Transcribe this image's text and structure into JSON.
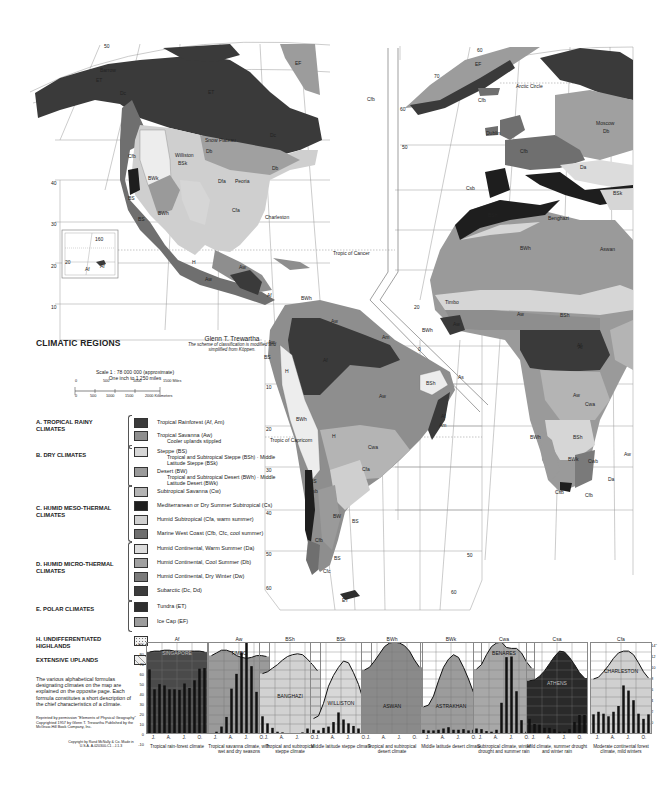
{
  "legend": {
    "title": "CLIMATIC REGIONS",
    "author": "Glenn T. Trewartha",
    "author_note": "The scheme of classification is modified and simplified from Köppen.",
    "scale": {
      "line1": "Scale 1 : 78 000 000 (approximate)",
      "line2": "One inch to 1 250 miles",
      "miles_ticks": [
        "0",
        "500",
        "1000",
        "1500 Miles"
      ],
      "km_ticks": [
        "0",
        "500",
        "1000",
        "1500",
        "2000 Kilometers"
      ]
    },
    "groups": [
      {
        "label": "A. TROPICAL RAINY CLIMATES",
        "items": [
          {
            "label": "Tropical Rainforest (Af, Am)",
            "sub": "",
            "color": "#3a3a3a"
          },
          {
            "label": "Tropical Savanna (Aw)",
            "sub": "Cooler uplands stippled",
            "color": "#8e8e8e"
          }
        ]
      },
      {
        "label": "B. DRY CLIMATES",
        "items": [
          {
            "label": "Steppe (BS)",
            "sub": "Tropical and Subtropical Steppe (BSh) · Middle Latitude Steppe (BSk)",
            "color": "#d6d6d6"
          },
          {
            "label": "Desert (BW)",
            "sub": "Tropical and Subtropical Desert (BWh) · Middle Latitude Desert (BWk)",
            "color": "#9a9a9a"
          }
        ]
      },
      {
        "label": "C. HUMID MESO-THERMAL CLIMATES",
        "items": [
          {
            "label": "Subtropical Savanna (Cw)",
            "sub": "",
            "color": "#b4b4b4"
          },
          {
            "label": "Mediterranean or Dry Summer Subtropical (Cs)",
            "sub": "",
            "color": "#1e1e1e"
          },
          {
            "label": "Humid Subtropical (Cfa, warm summer)",
            "sub": "",
            "color": "#cfcfcf"
          },
          {
            "label": "Marine West Coast (Cfb, Cfc, cool summer)",
            "sub": "",
            "color": "#6f6f6f"
          }
        ]
      },
      {
        "label": "D. HUMID MICRO-THERMAL CLIMATES",
        "items": [
          {
            "label": "Humid Continental, Warm Summer (Da)",
            "sub": "",
            "color": "#dcdcdc"
          },
          {
            "label": "Humid Continental, Cool Summer (Db)",
            "sub": "",
            "color": "#a0a0a0"
          },
          {
            "label": "Humid Continental, Dry Winter (Dw)",
            "sub": "",
            "color": "#7a7a7a"
          },
          {
            "label": "Subarctic (Dc, Dd)",
            "sub": "",
            "color": "#3c3c3c"
          }
        ]
      },
      {
        "label": "E. POLAR CLIMATES",
        "items": [
          {
            "label": "Tundra (ET)",
            "sub": "",
            "color": "#2e2e2e"
          },
          {
            "label": "Ice Cap (EF)",
            "sub": "",
            "color": "#9c9c9c"
          }
        ]
      },
      {
        "label": "H. UNDIFFERENTIATED HIGHLANDS",
        "items": [
          {
            "label": "",
            "sub": "",
            "color": "#f2f2f2"
          }
        ]
      },
      {
        "label": "EXTENSIVE UPLANDS",
        "items": [
          {
            "label": "",
            "sub": "",
            "color": "#ededed"
          }
        ]
      }
    ],
    "note": "The various alphabetical formulas designating climates on the map are explained on the opposite page. Each formula constitutes a short description of the chief characteristics of a climate.",
    "credit": "Reprinted by permission \"Elements of Physical Geography\" Copyrighted 1957 by Glenn T. Trewartha Published by the McGraw-Hill Book Company, Inc.",
    "credit2": "Copyright by Rand McNally & Co. Made in U.S.A. A-020300-C1 - J.1.3"
  },
  "map_labels": [
    {
      "t": "Barrow",
      "x": 100,
      "y": 67
    },
    {
      "t": "ET",
      "x": 96,
      "y": 77
    },
    {
      "t": "Dc",
      "x": 120,
      "y": 90
    },
    {
      "t": "ET",
      "x": 208,
      "y": 89
    },
    {
      "t": "EF",
      "x": 295,
      "y": 60
    },
    {
      "t": "Dc",
      "x": 270,
      "y": 132
    },
    {
      "t": "Snow Plateau",
      "x": 205,
      "y": 137
    },
    {
      "t": "Cfb",
      "x": 128,
      "y": 153
    },
    {
      "t": "Db",
      "x": 206,
      "y": 148
    },
    {
      "t": "Williston",
      "x": 175,
      "y": 152
    },
    {
      "t": "BSk",
      "x": 178,
      "y": 160
    },
    {
      "t": "Db",
      "x": 272,
      "y": 165
    },
    {
      "t": "Dfa",
      "x": 218,
      "y": 178
    },
    {
      "t": "Peoria",
      "x": 235,
      "y": 178
    },
    {
      "t": "BWk",
      "x": 148,
      "y": 175
    },
    {
      "t": "BS",
      "x": 128,
      "y": 195
    },
    {
      "t": "Cfa",
      "x": 232,
      "y": 207
    },
    {
      "t": "Charleston",
      "x": 265,
      "y": 214
    },
    {
      "t": "BWh",
      "x": 158,
      "y": 210
    },
    {
      "t": "BS",
      "x": 138,
      "y": 216
    },
    {
      "t": "H",
      "x": 192,
      "y": 259
    },
    {
      "t": "Aw",
      "x": 239,
      "y": 264
    },
    {
      "t": "Aw",
      "x": 205,
      "y": 276
    },
    {
      "t": "Af",
      "x": 267,
      "y": 292
    },
    {
      "t": "BWh",
      "x": 301,
      "y": 295
    },
    {
      "t": "Af",
      "x": 85,
      "y": 266
    },
    {
      "t": "Tropic of Cancer",
      "x": 333,
      "y": 250
    },
    {
      "t": "Arctic Circle",
      "x": 516,
      "y": 83
    },
    {
      "t": "EF",
      "x": 475,
      "y": 61
    },
    {
      "t": "Cfb",
      "x": 478,
      "y": 97
    },
    {
      "t": "Cfb",
      "x": 367,
      "y": 96
    },
    {
      "t": "Dublin",
      "x": 486,
      "y": 130
    },
    {
      "t": "Moscow",
      "x": 596,
      "y": 120
    },
    {
      "t": "Db",
      "x": 603,
      "y": 128
    },
    {
      "t": "Cfb",
      "x": 520,
      "y": 148
    },
    {
      "t": "Da",
      "x": 580,
      "y": 164
    },
    {
      "t": "Csb",
      "x": 466,
      "y": 185
    },
    {
      "t": "BSk",
      "x": 613,
      "y": 190
    },
    {
      "t": "BSh",
      "x": 488,
      "y": 212
    },
    {
      "t": "Benghazi",
      "x": 548,
      "y": 215
    },
    {
      "t": "BWh",
      "x": 520,
      "y": 245
    },
    {
      "t": "Aswan",
      "x": 600,
      "y": 246
    },
    {
      "t": "Timbo",
      "x": 445,
      "y": 299
    },
    {
      "t": "BSh",
      "x": 560,
      "y": 312
    },
    {
      "t": "Aw",
      "x": 517,
      "y": 311
    },
    {
      "t": "Aw",
      "x": 453,
      "y": 321
    },
    {
      "t": "BWh",
      "x": 422,
      "y": 327
    },
    {
      "t": "Af",
      "x": 578,
      "y": 344
    },
    {
      "t": "Aw",
      "x": 331,
      "y": 318
    },
    {
      "t": "Am",
      "x": 382,
      "y": 334
    },
    {
      "t": "Aw",
      "x": 268,
      "y": 339
    },
    {
      "t": "BS",
      "x": 264,
      "y": 354
    },
    {
      "t": "Af",
      "x": 323,
      "y": 357
    },
    {
      "t": "H",
      "x": 285,
      "y": 368
    },
    {
      "t": "BSh",
      "x": 426,
      "y": 380
    },
    {
      "t": "As",
      "x": 458,
      "y": 374
    },
    {
      "t": "Aw",
      "x": 379,
      "y": 393
    },
    {
      "t": "BWh",
      "x": 296,
      "y": 416
    },
    {
      "t": "Af",
      "x": 441,
      "y": 413
    },
    {
      "t": "Am",
      "x": 439,
      "y": 422
    },
    {
      "t": "Tropic of Capricorn",
      "x": 270,
      "y": 437
    },
    {
      "t": "H",
      "x": 332,
      "y": 433
    },
    {
      "t": "Cwa",
      "x": 368,
      "y": 444
    },
    {
      "t": "Cfa",
      "x": 362,
      "y": 466
    },
    {
      "t": "BS",
      "x": 310,
      "y": 478
    },
    {
      "t": "Csb",
      "x": 309,
      "y": 488
    },
    {
      "t": "BW",
      "x": 333,
      "y": 513
    },
    {
      "t": "BS",
      "x": 352,
      "y": 518
    },
    {
      "t": "Cfb",
      "x": 315,
      "y": 537
    },
    {
      "t": "BS",
      "x": 334,
      "y": 555
    },
    {
      "t": "Cfc",
      "x": 323,
      "y": 568
    },
    {
      "t": "ET",
      "x": 342,
      "y": 597
    },
    {
      "t": "Af",
      "x": 577,
      "y": 342
    },
    {
      "t": "Aw",
      "x": 573,
      "y": 392
    },
    {
      "t": "Cwa",
      "x": 585,
      "y": 401
    },
    {
      "t": "BWh",
      "x": 530,
      "y": 434
    },
    {
      "t": "BSh",
      "x": 573,
      "y": 434
    },
    {
      "t": "BWk",
      "x": 568,
      "y": 456
    },
    {
      "t": "Cwb",
      "x": 588,
      "y": 458
    },
    {
      "t": "Aw",
      "x": 624,
      "y": 451
    },
    {
      "t": "Da",
      "x": 608,
      "y": 476
    },
    {
      "t": "Csb",
      "x": 555,
      "y": 489
    },
    {
      "t": "Cfb",
      "x": 585,
      "y": 492
    }
  ],
  "latitude_ticks": [
    {
      "t": "50",
      "x": 104,
      "y": 43
    },
    {
      "t": "40",
      "x": 51,
      "y": 180
    },
    {
      "t": "30",
      "x": 51,
      "y": 221
    },
    {
      "t": "20",
      "x": 51,
      "y": 263
    },
    {
      "t": "10",
      "x": 51,
      "y": 304
    },
    {
      "t": "60",
      "x": 477,
      "y": 47
    },
    {
      "t": "70",
      "x": 434,
      "y": 73
    },
    {
      "t": "60",
      "x": 400,
      "y": 106
    },
    {
      "t": "50",
      "x": 402,
      "y": 144
    },
    {
      "t": "20",
      "x": 414,
      "y": 304
    },
    {
      "t": "0",
      "x": 418,
      "y": 346
    },
    {
      "t": "10",
      "x": 266,
      "y": 384
    },
    {
      "t": "20",
      "x": 266,
      "y": 426
    },
    {
      "t": "30",
      "x": 266,
      "y": 467
    },
    {
      "t": "40",
      "x": 266,
      "y": 510
    },
    {
      "t": "50",
      "x": 266,
      "y": 551
    },
    {
      "t": "60",
      "x": 266,
      "y": 585
    },
    {
      "t": "50",
      "x": 467,
      "y": 552
    },
    {
      "t": "60",
      "x": 451,
      "y": 589
    },
    {
      "t": "160",
      "x": 95,
      "y": 236
    },
    {
      "t": "20",
      "x": 65,
      "y": 259
    },
    {
      "t": "Af",
      "x": 100,
      "y": 263
    }
  ],
  "chart_data": [
    {
      "type": "climograph",
      "code": "Af",
      "station": "SINGAPORE",
      "caption": "Tropical rain-forest climate",
      "fill": "#4a4a4a",
      "temp_curve": [
        80,
        81,
        81,
        82,
        82,
        81,
        81,
        81,
        81,
        81,
        81,
        80
      ],
      "precip": [
        9.9,
        6.8,
        7.6,
        7.4,
        6.8,
        6.8,
        6.7,
        7.7,
        7.0,
        8.2,
        10.0,
        10.1
      ]
    },
    {
      "type": "climograph",
      "code": "Aw",
      "station": "TIMBO",
      "caption": "Tropical savanna climate, with wet and dry seasons",
      "fill": "#9a9a9a",
      "temp_curve": [
        76,
        79,
        82,
        82,
        80,
        76,
        74,
        73,
        74,
        76,
        76,
        75
      ],
      "precip": [
        0,
        0.2,
        1.0,
        2.5,
        6.9,
        9.2,
        12.5,
        14.5,
        10.4,
        6.4,
        1.2,
        0
      ]
    },
    {
      "type": "climograph",
      "code": "BSh",
      "station": "BANGHAZI",
      "caption": "Tropical and subtropical steppe climate",
      "fill": "#d2d2d2",
      "temp_curve": [
        56,
        58,
        62,
        66,
        71,
        75,
        77,
        78,
        77,
        72,
        66,
        59
      ],
      "precip": [
        2.6,
        1.5,
        0.8,
        0.2,
        0.1,
        0,
        0,
        0,
        0.1,
        0.7,
        1.8,
        2.4
      ]
    },
    {
      "type": "climograph",
      "code": "BSk",
      "station": "WILLISTON",
      "caption": "Middle latitude steppe climate",
      "fill": "#d8d8d8",
      "temp_curve": [
        6,
        9,
        23,
        42,
        54,
        63,
        70,
        68,
        57,
        44,
        26,
        12
      ],
      "precip": [
        0.5,
        0.4,
        0.8,
        1.0,
        1.7,
        3.2,
        2.1,
        1.5,
        1.1,
        0.7,
        0.5,
        0.4
      ]
    },
    {
      "type": "climograph",
      "code": "BWh",
      "station": "ASWAN",
      "caption": "Tropical and subtropical desert climate",
      "fill": "#8a8a8a",
      "temp_curve": [
        60,
        63,
        70,
        78,
        86,
        90,
        91,
        90,
        87,
        81,
        71,
        63
      ],
      "precip": [
        0,
        0,
        0,
        0,
        0,
        0,
        0,
        0,
        0,
        0,
        0,
        0
      ]
    },
    {
      "type": "climograph",
      "code": "BWk",
      "station": "ASTRAKHAN",
      "caption": "Middle latitude desert climate",
      "fill": "#9c9c9c",
      "temp_curve": [
        19,
        21,
        31,
        48,
        63,
        72,
        77,
        74,
        63,
        50,
        35,
        26
      ],
      "precip": [
        0.5,
        0.4,
        0.4,
        0.5,
        0.7,
        0.9,
        0.5,
        0.5,
        0.6,
        0.4,
        0.5,
        0.6
      ]
    },
    {
      "type": "climograph",
      "code": "Cwa",
      "station": "BENARES",
      "caption": "Subtropical climate, winter drought and summer rain",
      "fill": "#a8a8a8",
      "temp_curve": [
        61,
        66,
        77,
        86,
        90,
        91,
        85,
        84,
        84,
        79,
        69,
        62
      ],
      "precip": [
        0.7,
        0.6,
        0.3,
        0.2,
        0.5,
        4.7,
        11.8,
        11.9,
        6.5,
        2.0,
        0.2,
        0.2
      ]
    },
    {
      "type": "climograph",
      "code": "Csa",
      "station": "ATHENS",
      "caption": "Mild climate, summer drought and winter rain",
      "fill": "#2a2a2a",
      "temp_curve": [
        48,
        49,
        53,
        59,
        67,
        75,
        81,
        80,
        74,
        66,
        57,
        51
      ],
      "precip": [
        2.2,
        1.4,
        1.3,
        0.8,
        0.8,
        0.6,
        0.2,
        0.2,
        0.6,
        1.7,
        2.8,
        2.8
      ]
    },
    {
      "type": "climograph",
      "code": "Cfa",
      "station": "CHARLESTON",
      "caption": "Moderate continental forest climate, mild winters",
      "fill": "#d0d0d0",
      "temp_curve": [
        50,
        52,
        58,
        65,
        73,
        79,
        81,
        81,
        77,
        68,
        58,
        51
      ],
      "precip": [
        2.9,
        3.3,
        3.0,
        2.6,
        3.3,
        4.2,
        7.4,
        6.6,
        5.1,
        3.0,
        2.2,
        2.9
      ]
    }
  ],
  "chart_axes": {
    "temp_ticks": [
      "90°",
      "80",
      "70",
      "60",
      "50",
      "40",
      "30",
      "20",
      "10",
      "0",
      "-10"
    ],
    "precip_ticks": [
      "14\"",
      "12",
      "10",
      "8",
      "6",
      "4",
      "2",
      "0"
    ],
    "months": [
      "J.",
      "A.",
      "J.",
      "O."
    ],
    "months_vertical": [
      "Jan.",
      "Apr.",
      "July",
      "Oct."
    ]
  }
}
